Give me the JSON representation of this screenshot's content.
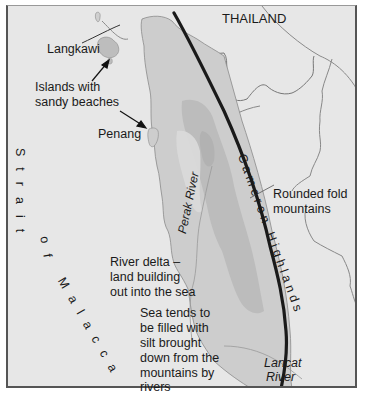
{
  "map": {
    "title": "Malay Peninsula – physical features",
    "colors": {
      "sea": "#e7e7e7",
      "land": "#cdcdcd",
      "highland": "#b9b9b9",
      "lowland_light": "#d9d9d9",
      "mountain_axis": "#1a1a1a",
      "border_line": "#8a8a8a",
      "frame": "#555555"
    },
    "labels": {
      "country": "THAILAND",
      "langkawi": "Langkawi",
      "islands_note": [
        "Islands with",
        "sandy beaches"
      ],
      "penang": "Penang",
      "strait": "Strait of Malacca",
      "strait_chars": [
        "S",
        "t",
        "r",
        "a",
        "i",
        "t",
        "o",
        "f",
        "M",
        "a",
        "l",
        "a",
        "c",
        "c",
        "a"
      ],
      "perak_river": "Perak River",
      "cameron_highlands": "Cameron Highlands",
      "fold_mountains": [
        "Rounded fold",
        "mountains"
      ],
      "river_delta": [
        "River delta –",
        "land building",
        "out into the sea"
      ],
      "silt_note": [
        "Sea tends to",
        "be filled with",
        "silt brought",
        "down from the",
        "mountains by",
        "rivers"
      ],
      "lancat_river": [
        "Lancat",
        "River"
      ]
    }
  }
}
